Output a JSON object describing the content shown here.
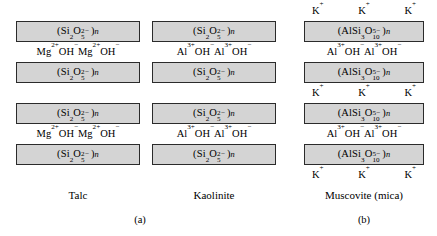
{
  "figure": {
    "type": "diagram",
    "panels": [
      {
        "caption": "(a)",
        "columns": [
          {
            "mineral": "Talc",
            "sheet_formula": "(Si2O5^2-)n",
            "interlayer_formula": "Mg2+OH- Mg2+OH-",
            "rows": [
              {
                "kind": "sheet",
                "text": "sheet_si"
              },
              {
                "kind": "interlayer",
                "text": "mg_oh"
              },
              {
                "kind": "sheet",
                "text": "sheet_si"
              },
              {
                "kind": "gap",
                "text": ""
              },
              {
                "kind": "sheet",
                "text": "sheet_si"
              },
              {
                "kind": "interlayer",
                "text": "mg_oh"
              },
              {
                "kind": "sheet",
                "text": "sheet_si"
              }
            ]
          },
          {
            "mineral": "Kaolinite",
            "sheet_formula": "(Si2O5^2-)n",
            "interlayer_formula": "Al3+OH- Al3+OH-",
            "rows": [
              {
                "kind": "sheet",
                "text": "sheet_si"
              },
              {
                "kind": "interlayer",
                "text": "al_oh"
              },
              {
                "kind": "sheet",
                "text": "sheet_si"
              },
              {
                "kind": "gap",
                "text": ""
              },
              {
                "kind": "sheet",
                "text": "sheet_si"
              },
              {
                "kind": "interlayer",
                "text": "al_oh"
              },
              {
                "kind": "sheet",
                "text": "sheet_si"
              }
            ]
          }
        ]
      },
      {
        "caption": "(b)",
        "columns": [
          {
            "mineral": "Muscovite (mica)",
            "sheet_formula": "(AlSi3O10^5-)n",
            "interlayer_formula": "Al3+OH- Al3+OH-",
            "cation": "K+",
            "cation_count": 3,
            "rows": [
              {
                "kind": "cations",
                "text": "k_row"
              },
              {
                "kind": "sheet",
                "text": "sheet_alsi"
              },
              {
                "kind": "interlayer",
                "text": "al_oh"
              },
              {
                "kind": "sheet",
                "text": "sheet_alsi"
              },
              {
                "kind": "cations",
                "text": "k_row"
              },
              {
                "kind": "sheet",
                "text": "sheet_alsi"
              },
              {
                "kind": "interlayer",
                "text": "al_oh"
              },
              {
                "kind": "sheet",
                "text": "sheet_alsi"
              },
              {
                "kind": "cations",
                "text": "k_row"
              }
            ]
          }
        ]
      }
    ],
    "labels": {
      "talc": "Talc",
      "kaolinite": "Kaolinite",
      "muscovite": "Muscovite (mica)",
      "caption_a": "(a)",
      "caption_b": "(b)"
    },
    "ions": {
      "potassium": "K",
      "potassium_charge": "+",
      "magnesium": "Mg",
      "magnesium_charge": "2+",
      "aluminum": "Al",
      "aluminum_charge": "3+",
      "hydroxide": "OH",
      "hydroxide_charge": "−"
    },
    "colors": {
      "sheet_fill": "#d4d4d4",
      "sheet_border": "#2b2b2b",
      "text": "#000000",
      "background": "#ffffff"
    }
  }
}
